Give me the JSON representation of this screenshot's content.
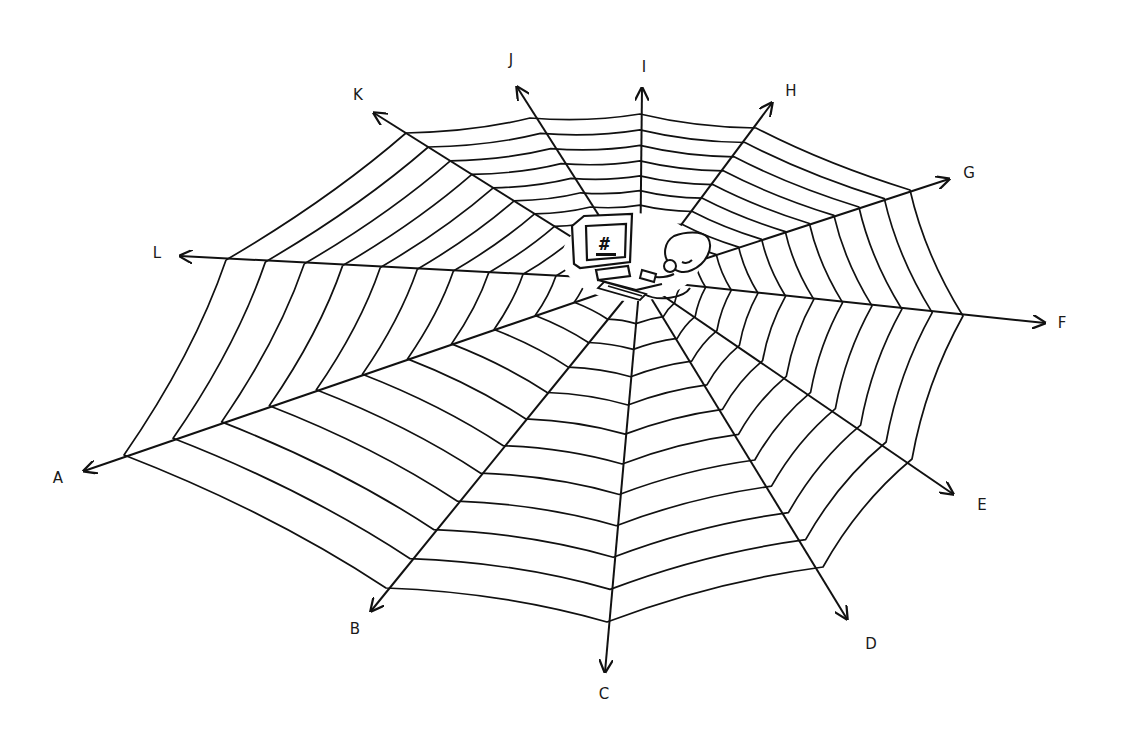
{
  "diagram": {
    "type": "spider-web",
    "center": [
      640,
      280
    ],
    "stroke_color": "#111111",
    "background": "#ffffff",
    "rings": 12,
    "spokes": [
      {
        "label": "A",
        "label_pos": [
          58,
          478
        ],
        "tip": [
          84,
          471
        ],
        "end": [
          124,
          455
        ]
      },
      {
        "label": "B",
        "label_pos": [
          355,
          629
        ],
        "tip": [
          371,
          611
        ],
        "end": [
          386,
          588
        ]
      },
      {
        "label": "C",
        "label_pos": [
          604,
          694
        ],
        "tip": [
          605,
          672
        ],
        "end": [
          607,
          622
        ]
      },
      {
        "label": "D",
        "label_pos": [
          871,
          644
        ],
        "tip": [
          847,
          619
        ],
        "end": [
          823,
          567
        ]
      },
      {
        "label": "E",
        "label_pos": [
          982,
          505
        ],
        "tip": [
          953,
          494
        ],
        "end": [
          912,
          459
        ]
      },
      {
        "label": "F",
        "label_pos": [
          1062,
          323
        ],
        "tip": [
          1045,
          323
        ],
        "end": [
          963,
          316
        ]
      },
      {
        "label": "G",
        "label_pos": [
          969,
          173
        ],
        "tip": [
          949,
          179
        ],
        "end": [
          910,
          190
        ]
      },
      {
        "label": "H",
        "label_pos": [
          791,
          91
        ],
        "tip": [
          772,
          103
        ],
        "end": [
          756,
          128
        ]
      },
      {
        "label": "I",
        "label_pos": [
          644,
          67
        ],
        "tip": [
          642,
          88
        ],
        "end": [
          640,
          114
        ]
      },
      {
        "label": "J",
        "label_pos": [
          511,
          60
        ],
        "tip": [
          517,
          87
        ],
        "end": [
          530,
          118
        ]
      },
      {
        "label": "K",
        "label_pos": [
          358,
          95
        ],
        "tip": [
          374,
          113
        ],
        "end": [
          406,
          133
        ]
      },
      {
        "label": "L",
        "label_pos": [
          157,
          253
        ],
        "tip": [
          180,
          256
        ],
        "end": [
          226,
          260
        ]
      }
    ],
    "hub": {
      "figure": "person-at-computer",
      "screen_glyph": "#"
    }
  }
}
